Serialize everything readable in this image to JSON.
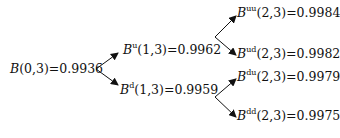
{
  "diagram": {
    "type": "binomial-tree",
    "root": {
      "symbol": "B",
      "superscript": "",
      "args": "(0,3)",
      "value": "=0.9936"
    },
    "level1": [
      {
        "symbol": "B",
        "superscript": "u",
        "args": "(1,3)",
        "value": "=0.9962"
      },
      {
        "symbol": "B",
        "superscript": "d",
        "args": "(1,3)",
        "value": "=0.9959"
      }
    ],
    "level2": [
      {
        "symbol": "B",
        "superscript": "uu",
        "args": "(2,3)",
        "value": "=0.9984"
      },
      {
        "symbol": "B",
        "superscript": "ud",
        "args": "(2,3)",
        "value": "=0.9982"
      },
      {
        "symbol": "B",
        "superscript": "du",
        "args": "(2,3)",
        "value": "=0.9979"
      },
      {
        "symbol": "B",
        "superscript": "dd",
        "args": "(2,3)",
        "value": "=0.9975"
      }
    ],
    "colors": {
      "text": "#111111",
      "arrow": "#111111",
      "background": "#ffffff"
    }
  }
}
